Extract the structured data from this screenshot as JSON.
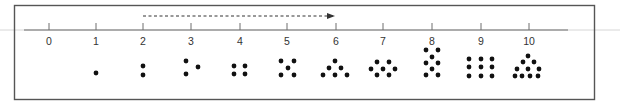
{
  "diagram": {
    "title": "",
    "colors": {
      "frame": "#555555",
      "axis": "#6e6e6e",
      "axis_extension": "#d6d6d6",
      "tick": "#6e6e6e",
      "label": "#333333",
      "dot": "#111111",
      "arrow": "#333333"
    },
    "number_line": {
      "labels": [
        "0",
        "1",
        "2",
        "3",
        "4",
        "5",
        "6",
        "7",
        "8",
        "9",
        "10"
      ],
      "tick_x": [
        49,
        96,
        143,
        191,
        240,
        287,
        336,
        383,
        432,
        481,
        529
      ]
    },
    "arrow": {
      "style": "dashed",
      "from_label": "2",
      "to_label": "6",
      "direction": "right"
    },
    "dot_patterns": [
      {
        "label": "0",
        "count": 0,
        "dots": []
      },
      {
        "label": "1",
        "count": 1,
        "dots": [
          [
            96,
            73
          ]
        ]
      },
      {
        "label": "2",
        "count": 2,
        "dots": [
          [
            143,
            66
          ],
          [
            143,
            75
          ]
        ]
      },
      {
        "label": "3",
        "count": 3,
        "dots": [
          [
            186,
            61
          ],
          [
            198,
            67
          ],
          [
            186,
            74
          ]
        ]
      },
      {
        "label": "4",
        "count": 4,
        "dots": [
          [
            234,
            66
          ],
          [
            245,
            66
          ],
          [
            234,
            74
          ],
          [
            245,
            74
          ]
        ]
      },
      {
        "label": "5",
        "count": 5,
        "dots": [
          [
            281,
            61
          ],
          [
            294,
            61
          ],
          [
            288,
            68
          ],
          [
            281,
            75
          ],
          [
            294,
            75
          ]
        ]
      },
      {
        "label": "6",
        "count": 6,
        "dots": [
          [
            335,
            61
          ],
          [
            329,
            68
          ],
          [
            341,
            68
          ],
          [
            323,
            75
          ],
          [
            335,
            75
          ],
          [
            347,
            75
          ]
        ]
      },
      {
        "label": "7",
        "count": 7,
        "dots": [
          [
            377,
            62
          ],
          [
            389,
            62
          ],
          [
            371,
            69
          ],
          [
            383,
            69
          ],
          [
            395,
            69
          ],
          [
            377,
            75
          ],
          [
            389,
            75
          ]
        ]
      },
      {
        "label": "8",
        "count": 8,
        "dots": [
          [
            426,
            50
          ],
          [
            438,
            50
          ],
          [
            432,
            57
          ],
          [
            426,
            63
          ],
          [
            438,
            63
          ],
          [
            432,
            69
          ],
          [
            426,
            75
          ],
          [
            438,
            75
          ]
        ]
      },
      {
        "label": "9",
        "count": 9,
        "dots": [
          [
            469,
            59
          ],
          [
            481,
            59
          ],
          [
            492,
            59
          ],
          [
            469,
            67
          ],
          [
            481,
            67
          ],
          [
            492,
            67
          ],
          [
            469,
            76
          ],
          [
            481,
            76
          ],
          [
            492,
            76
          ]
        ]
      },
      {
        "label": "10",
        "count": 10,
        "dots": [
          [
            528,
            56
          ],
          [
            523,
            62
          ],
          [
            534,
            62
          ],
          [
            517,
            69
          ],
          [
            528,
            69
          ],
          [
            539,
            69
          ],
          [
            515,
            76
          ],
          [
            522,
            76
          ],
          [
            530,
            76
          ],
          [
            538,
            76
          ]
        ]
      }
    ]
  }
}
